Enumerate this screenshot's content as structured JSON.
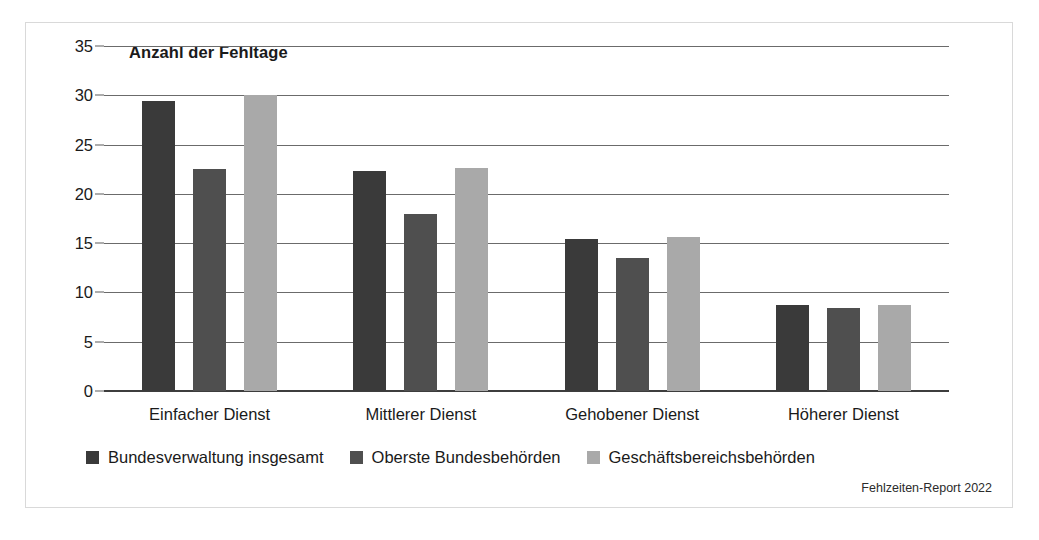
{
  "figure": {
    "source_note": "Fehlzeiten-Report 2022",
    "frame_color": "#d9d9d9",
    "background": "#ffffff"
  },
  "chart_data": {
    "type": "bar",
    "title": "Anzahl der Fehltage",
    "xlabel": "",
    "ylabel": "Anzahl der Fehltage",
    "ylim": [
      0,
      35
    ],
    "ytick_step": 5,
    "yticks": [
      0,
      5,
      10,
      15,
      20,
      25,
      30,
      35
    ],
    "ytick_labels": [
      "0",
      "5",
      "10",
      "15",
      "20",
      "25",
      "30",
      "35"
    ],
    "grid": true,
    "grid_axis": "y",
    "legend_position": "bottom-left",
    "categories": [
      "Einfacher Dienst",
      "Mittlerer Dienst",
      "Gehobener Dienst",
      "Höherer Dienst"
    ],
    "series": [
      {
        "name": "Bundesverwaltung insgesamt",
        "color": "#3a3a3a",
        "values": [
          29.4,
          22.3,
          15.4,
          8.7
        ]
      },
      {
        "name": "Oberste Bundesbehörden",
        "color": "#4f4f4f",
        "values": [
          22.5,
          18.0,
          13.5,
          8.4
        ]
      },
      {
        "name": "Geschäftsbereichsbehörden",
        "color": "#a9a9a9",
        "values": [
          30.0,
          22.6,
          15.6,
          8.7
        ]
      }
    ]
  }
}
